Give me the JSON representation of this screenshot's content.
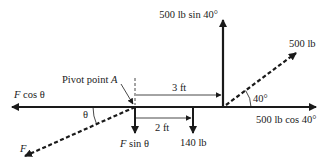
{
  "diagram": {
    "type": "free-body force diagram",
    "colors": {
      "ink": "#1a1a1a",
      "background": "#ffffff"
    },
    "labels": {
      "vertical_force": "500 lb sin 40°",
      "applied_force": "500 lb",
      "horizontal_component": "500 lb cos 40°",
      "pivot": "Pivot point ",
      "pivot_var": "A",
      "f_cos_var": "F",
      "f_cos_rest": " cos θ",
      "f_sin_var": "F",
      "f_sin_rest": " sin θ",
      "f_var": "F",
      "theta": "θ",
      "angle_40": "40°",
      "dist_3ft": "3 ft",
      "dist_2ft": "2 ft",
      "weight": "140 lb"
    }
  }
}
